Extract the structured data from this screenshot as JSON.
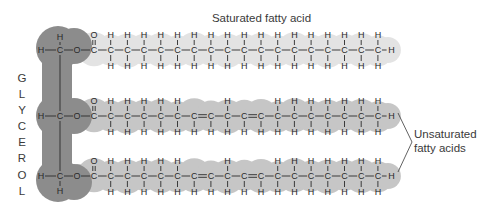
{
  "labels": {
    "saturated": "Saturated fatty acid",
    "unsaturated_line1": "Unsaturated",
    "unsaturated_line2": "fatty acids",
    "glycerol_letters": [
      "G",
      "L",
      "Y",
      "C",
      "E",
      "R",
      "O",
      "L"
    ]
  },
  "colors": {
    "glycerol": "#8c8c8c",
    "saturated": "#e3e3e3",
    "unsaturated": "#c6c6c6",
    "text": "#2a2a2a"
  },
  "glycerol": {
    "description": "Glycerol backbone: three carbons (CH2, CH, CH2) each bonded through O to a fatty acid",
    "carbons": [
      {
        "row": 0,
        "left_atom": "H",
        "top_atom": "H",
        "bottom_atom": null
      },
      {
        "row": 1,
        "left_atom": "H",
        "top_atom": null,
        "bottom_atom": null
      },
      {
        "row": 2,
        "left_atom": "H",
        "top_atom": null,
        "bottom_atom": "H"
      }
    ]
  },
  "fatty_acids": [
    {
      "name": "Saturated fatty acid",
      "type": "saturated",
      "row_y": 50,
      "carbon_count": 18,
      "chain": [
        "C=O",
        "CH2",
        "CH2",
        "CH2",
        "CH2",
        "CH2",
        "CH2",
        "CH2",
        "CH2",
        "CH2",
        "CH2",
        "CH2",
        "CH2",
        "CH2",
        "CH2",
        "CH2",
        "CH2",
        "CH3"
      ]
    },
    {
      "name": "Unsaturated fatty acid 1",
      "type": "unsaturated",
      "row_y": 116,
      "carbon_count": 18,
      "chain": [
        "C=O",
        "CH2",
        "CH2",
        "CH2",
        "CH2",
        "CH2",
        "CH=",
        "=CH",
        "CH2",
        "CH=",
        "=CH",
        "CH2",
        "CH2",
        "CH2",
        "CH2",
        "CH2",
        "CH2",
        "CH3"
      ]
    },
    {
      "name": "Unsaturated fatty acid 2",
      "type": "unsaturated",
      "row_y": 176,
      "carbon_count": 18,
      "chain": [
        "C=O",
        "CH2",
        "CH2",
        "CH2",
        "CH2",
        "CH2",
        "CH=",
        "=CH",
        "CH2",
        "CH=",
        "=CH",
        "CH2",
        "CH2",
        "CH2",
        "CH2",
        "CH2",
        "CH2",
        "CH3"
      ]
    }
  ],
  "atoms": {
    "carbon": "C",
    "hydrogen": "H",
    "oxygen": "O"
  }
}
